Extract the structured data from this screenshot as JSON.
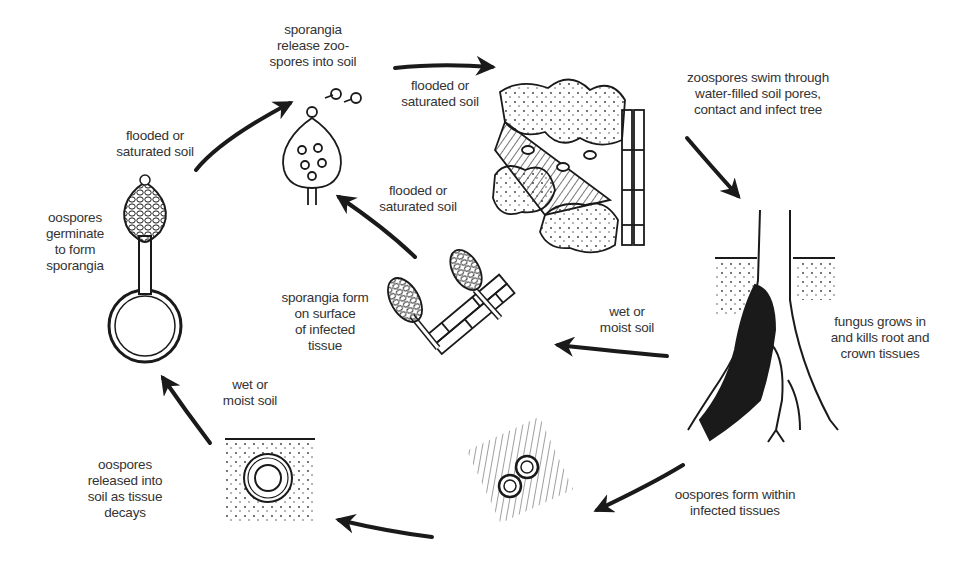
{
  "diagram": {
    "stages": [
      {
        "id": "sporangia-release",
        "label": "sporangia\nrelease zoo-\nspores into soil"
      },
      {
        "id": "zoospores-infect",
        "label": "zoospores swim through\nwater-filled soil pores,\ncontact and infect tree"
      },
      {
        "id": "fungus-grows",
        "label": "fungus grows in\nand kills root and\ncrown tissues"
      },
      {
        "id": "oospores-form",
        "label": "oospores form within\ninfected tissues"
      },
      {
        "id": "oospores-released",
        "label": "oospores\nreleased into\nsoil as tissue\ndecays"
      },
      {
        "id": "oospores-germinate",
        "label": "oospores\ngerminate\nto form\nsporangia"
      },
      {
        "id": "sporangia-form",
        "label": "sporangia form\non surface\nof infected\ntissue"
      }
    ],
    "conditions": [
      {
        "id": "flooded-1",
        "label": "flooded or\nsaturated soil"
      },
      {
        "id": "flooded-2",
        "label": "flooded or\nsaturated soil"
      },
      {
        "id": "flooded-3",
        "label": "flooded or\nsaturated soil"
      },
      {
        "id": "wet-1",
        "label": "wet or\nmoist soil"
      },
      {
        "id": "wet-2",
        "label": "wet or\nmoist soil"
      }
    ],
    "colors": {
      "ink": "#1a1a1a",
      "text": "#333333",
      "background": "#ffffff"
    }
  }
}
